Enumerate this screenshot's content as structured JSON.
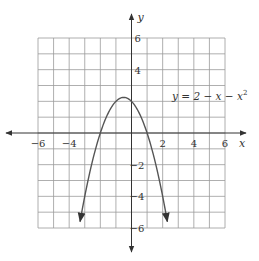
{
  "chart_data": {
    "type": "line",
    "title": "",
    "equation_label": "y = 2 − x − x²",
    "function": "2 - x - x^2",
    "xlabel": "x",
    "ylabel": "y",
    "xlim": [
      -6,
      6
    ],
    "ylim": [
      -6,
      6
    ],
    "grid": true,
    "grid_step": 1,
    "x_tick_labels": [
      "-6",
      "-4",
      "2",
      "4",
      "6"
    ],
    "x_tick_values": [
      -6,
      -4,
      2,
      4,
      6
    ],
    "y_tick_labels": [
      "6",
      "4",
      "-2",
      "-4",
      "-6"
    ],
    "y_tick_values": [
      6,
      4,
      -2,
      -4,
      -6
    ],
    "series": [
      {
        "name": "y = 2 - x - x^2",
        "x": [
          -3.3,
          -3,
          -2.5,
          -2,
          -1.5,
          -1,
          -0.5,
          0,
          0.5,
          1,
          1.5,
          2,
          2.3
        ],
        "y": [
          -5.59,
          -4,
          -1.75,
          0,
          1.25,
          2,
          2.25,
          2,
          1.25,
          0,
          -1.75,
          -4,
          -5.59
        ]
      }
    ],
    "vertex": [
      -0.5,
      2.25
    ],
    "arrows": [
      "both curve ends",
      "both axes ends"
    ],
    "colors": {
      "grid": "#9a9a9a",
      "axis": "#333333",
      "curve": "#555555"
    }
  }
}
